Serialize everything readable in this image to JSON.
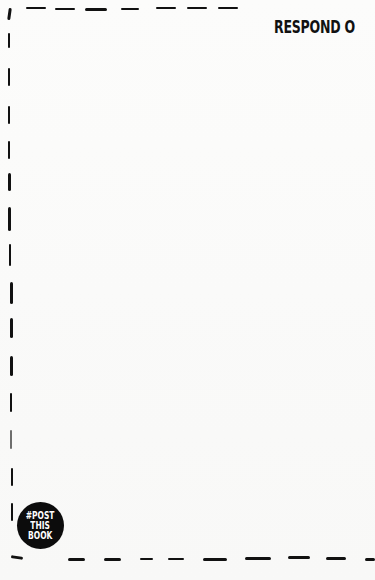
{
  "page": {
    "prompt_text": "RESPOND O",
    "badge": {
      "line1": "#POST",
      "line2": "THIS",
      "line3": "BOOK"
    }
  },
  "colors": {
    "ink": "#111111",
    "paper": "#fbfbfa"
  }
}
